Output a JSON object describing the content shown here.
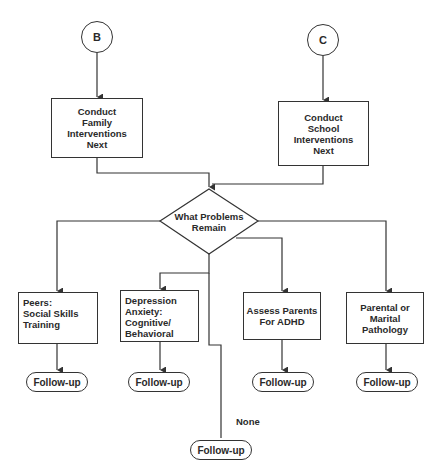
{
  "connectors": {
    "b": {
      "label": "B"
    },
    "c": {
      "label": "C"
    }
  },
  "steps": {
    "family": {
      "label": "Conduct\nFamily\nInterventions\nNext"
    },
    "school": {
      "label": "Conduct\nSchool Interventions\nNext"
    }
  },
  "decision": {
    "label": "What Problems\nRemain"
  },
  "branches": [
    {
      "label": "Peers:\nSocial Skills\nTraining",
      "followup": "Follow-up"
    },
    {
      "label": "Depression\nAnxiety:\nCognitive/\nBehavioral",
      "followup": "Follow-up"
    },
    {
      "label": "Assess Parents\nFor ADHD",
      "followup": "Follow-up"
    },
    {
      "label": "Parental or\nMarital\nPathology",
      "followup": "Follow-up"
    }
  ],
  "none_branch": {
    "label": "None",
    "followup": "Follow-up"
  },
  "colors": {
    "line": "#333333",
    "text": "#2a2a2a",
    "background": "#ffffff"
  }
}
